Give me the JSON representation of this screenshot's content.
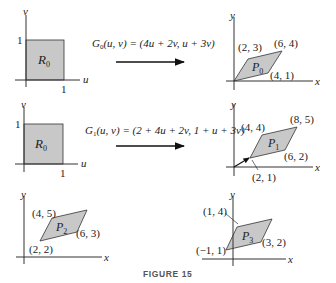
{
  "figure": {
    "caption": "FIGURE 15",
    "panels": [
      {
        "id": "r0-top",
        "region_label": "R",
        "region_sub": "0",
        "axes": {
          "x": "u",
          "y": "v"
        },
        "ticks": {
          "x": "1",
          "y": "1"
        }
      },
      {
        "id": "p0",
        "region_label": "P",
        "region_sub": "0",
        "axes": {
          "x": "x",
          "y": "y"
        },
        "vertices": [
          "(2, 3)",
          "(6, 4)",
          "(4, 1)"
        ]
      },
      {
        "id": "r0-mid",
        "region_label": "R",
        "region_sub": "0",
        "axes": {
          "x": "u",
          "y": "v"
        },
        "ticks": {
          "x": "1",
          "y": "1"
        }
      },
      {
        "id": "p1",
        "region_label": "P",
        "region_sub": "1",
        "axes": {
          "x": "x",
          "y": "y"
        },
        "vertices": [
          "(4, 4)",
          "(8, 5)",
          "(6, 2)",
          "(2, 1)"
        ]
      },
      {
        "id": "p2",
        "region_label": "P",
        "region_sub": "2",
        "axes": {
          "x": "x",
          "y": "y"
        },
        "vertices": [
          "(4, 5)",
          "(6, 3)",
          "(2, 2)"
        ]
      },
      {
        "id": "p3",
        "region_label": "P",
        "region_sub": "3",
        "axes": {
          "x": "x",
          "y": "y"
        },
        "vertices": [
          "(1, 4)",
          "(3, 2)",
          "(−1, 1)"
        ]
      }
    ],
    "maps": [
      {
        "name": "G",
        "sub": "0",
        "formula": "(u, v) = (4u + 2v, u + 3v)"
      },
      {
        "name": "G",
        "sub": "1",
        "formula": "(u, v) = (2 + 4u + 2v, 1 + u + 3v)"
      }
    ]
  }
}
